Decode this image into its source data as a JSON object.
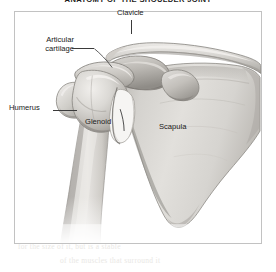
{
  "figure": {
    "title": "ANATOMY OF THE SHOULDER JOINT",
    "view": "anterior view of right shoulder",
    "frame": {
      "border_color": "#c2c2c2",
      "background_color": "#ffffff"
    }
  },
  "labels": {
    "clavicle": "Clavicle",
    "articular_cartilage_line1": "Articular",
    "articular_cartilage_line2": "cartilage",
    "humerus": "Humerus",
    "glenoid": "Glenoid",
    "scapula": "Scapula"
  },
  "structures": [
    {
      "name": "clavicle",
      "label": "Clavicle",
      "description": "S-curved collarbone running from upper-left to upper-right across the top of the joint"
    },
    {
      "name": "acromion",
      "label": "",
      "description": "flattened bony shelf of the scapula overhanging the humeral head"
    },
    {
      "name": "articular-cartilage",
      "label": "Articular cartilage",
      "description": "thin smooth cap on the superior surface of the humeral head"
    },
    {
      "name": "humerus",
      "label": "Humerus",
      "description": "upper arm bone with rounded head and tapering shaft at lower left"
    },
    {
      "name": "glenoid",
      "label": "Glenoid",
      "description": "shallow socket of the scapula articulating with the humeral head"
    },
    {
      "name": "scapula",
      "label": "Scapula",
      "description": "large triangular shoulder blade filling the right side, tapering to inferior angle"
    }
  ],
  "colors": {
    "bone_light": "#e3e1dd",
    "bone_mid": "#cdcac5",
    "bone_shadow": "#a8a5a0",
    "bone_deep_shadow": "#8b8884",
    "outline": "#6e6b67",
    "label_text": "#1a1a1a",
    "leader_line": "#3a3a3a",
    "frame_border": "#c2c2c2",
    "ghost_text": "#e9e7e4"
  },
  "ghost_text_lines": [
    {
      "text": "ties and the joint is a shallow ball",
      "x": 36,
      "y": 232
    },
    {
      "text": "for the size of it, but is a stable",
      "x": 18,
      "y": 246
    },
    {
      "text": "of the muscles that surround it",
      "x": 60,
      "y": 260
    }
  ]
}
